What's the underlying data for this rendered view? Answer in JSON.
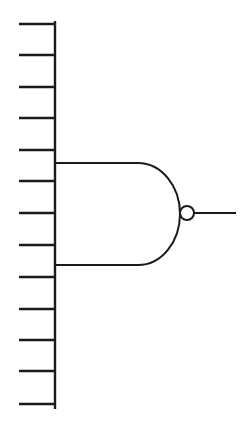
{
  "diagram": {
    "type": "logic-gate",
    "gate": "NAND",
    "input_count": 13,
    "line_color": "#1a1a1a",
    "background": "#ffffff",
    "bus": {
      "x": 55,
      "y_top": 21,
      "y_bottom": 409
    },
    "inputs": {
      "x_start": 19,
      "x_end": 55,
      "y_positions": [
        24,
        55,
        87,
        118,
        150,
        181,
        213,
        245,
        277,
        309,
        340,
        371,
        404
      ]
    },
    "gate_body": {
      "left_x": 55,
      "top_y": 163,
      "bottom_y": 265,
      "flat_end_x": 138,
      "arc_tip_x": 180,
      "center_y": 213
    },
    "inversion_bubble": {
      "cx": 187,
      "cy": 213,
      "r": 7
    },
    "output": {
      "x_start": 194,
      "x_end": 236,
      "y": 213
    }
  }
}
